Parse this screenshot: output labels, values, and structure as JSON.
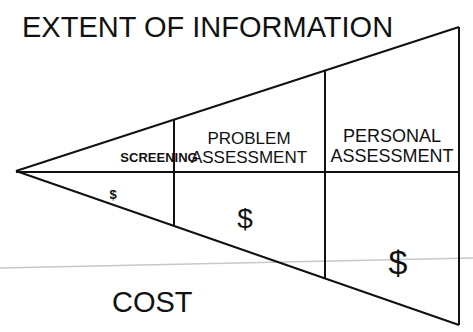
{
  "diagram": {
    "title": "EXTENT OF INFORMATION",
    "bottom_label": "COST",
    "segments": [
      {
        "name": "screening",
        "label_lines": [
          "SCREENING"
        ],
        "cost_symbol": "$",
        "cost_size": "small"
      },
      {
        "name": "problem-assessment",
        "label_lines": [
          "PROBLEM",
          "ASSESSMENT"
        ],
        "cost_symbol": "$",
        "cost_size": "medium"
      },
      {
        "name": "personal-assessment",
        "label_lines": [
          "PERSONAL",
          "ASSESSMENT"
        ],
        "cost_symbol": "$",
        "cost_size": "large"
      }
    ],
    "colors": {
      "line": "#111111",
      "text": "#111111",
      "faint_line": "#c8c8c8",
      "background": "#ffffff"
    }
  }
}
